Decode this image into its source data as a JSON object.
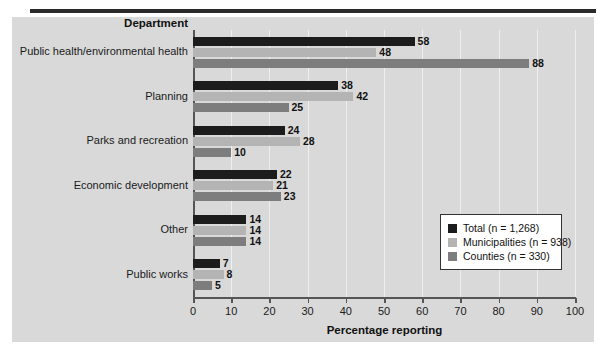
{
  "chart_data": {
    "type": "bar",
    "orientation": "horizontal",
    "title": "",
    "xlabel": "Percentage reporting",
    "ylabel": "Department",
    "xlim": [
      0,
      100
    ],
    "xticks": [
      0,
      10,
      20,
      30,
      40,
      50,
      60,
      70,
      80,
      90,
      100
    ],
    "grid": true,
    "legend_position": "lower-right",
    "categories": [
      "Public health/environmental health",
      "Planning",
      "Parks and recreation",
      "Economic development",
      "Other",
      "Public works"
    ],
    "series": [
      {
        "name": "Total (n = 1,268)",
        "color": "#1c1c1c",
        "values": [
          58,
          38,
          24,
          22,
          14,
          7
        ]
      },
      {
        "name": "Municipalities (n = 938)",
        "color": "#b4b4b4",
        "values": [
          48,
          42,
          28,
          21,
          14,
          8
        ]
      },
      {
        "name": "Counties (n = 330)",
        "color": "#7d7d7d",
        "values": [
          88,
          25,
          10,
          23,
          14,
          5
        ]
      }
    ]
  },
  "legend": {
    "items": [
      {
        "label": "Total (n = 1,268)"
      },
      {
        "label": "Municipalities (n = 938)"
      },
      {
        "label": "Counties (n = 330)"
      }
    ]
  },
  "axis": {
    "y_header": "Department",
    "x_title": "Percentage reporting",
    "x_tick_labels": [
      "0",
      "10",
      "20",
      "30",
      "40",
      "50",
      "60",
      "70",
      "80",
      "90",
      "100"
    ]
  }
}
